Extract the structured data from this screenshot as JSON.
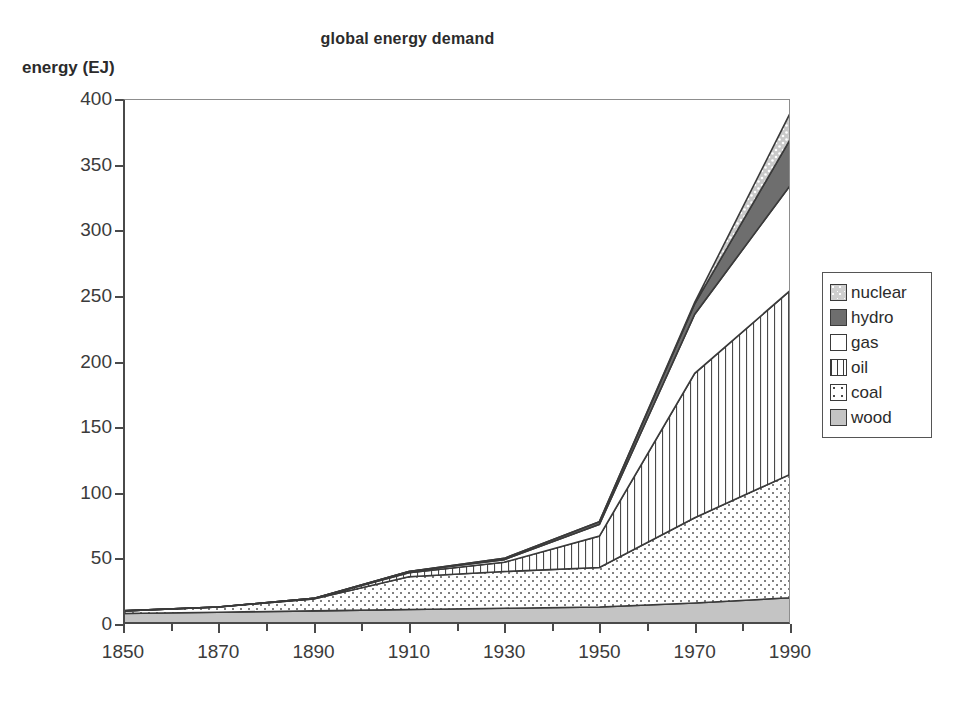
{
  "chart_data": {
    "type": "area",
    "title": "global energy demand",
    "xlabel": "",
    "ylabel": "energy (EJ)",
    "stacked": true,
    "grid": false,
    "legend_position": "right",
    "x": [
      1850,
      1870,
      1890,
      1910,
      1930,
      1950,
      1970,
      1990
    ],
    "categories": [
      "1850",
      "1870",
      "1890",
      "1910",
      "1930",
      "1950",
      "1970",
      "1990"
    ],
    "xlim": [
      1850,
      1990
    ],
    "ylim": [
      0,
      400
    ],
    "yticks": [
      "0",
      "50",
      "100",
      "150",
      "200",
      "250",
      "300",
      "350",
      "400"
    ],
    "ytick_values": [
      0,
      50,
      100,
      150,
      200,
      250,
      300,
      350,
      400
    ],
    "series": [
      {
        "name": "wood",
        "values": [
          8,
          9,
          10,
          11,
          12,
          13,
          16,
          20
        ],
        "color": "#c4c4c4",
        "pattern": "solid-light"
      },
      {
        "name": "coal",
        "values": [
          2,
          4,
          9,
          25,
          28,
          30,
          65,
          94
        ],
        "color": "#ffffff",
        "pattern": "dots"
      },
      {
        "name": "oil",
        "values": [
          0,
          0,
          0.5,
          3,
          7,
          24,
          110,
          140
        ],
        "color": "#ffffff",
        "pattern": "vertical-lines"
      },
      {
        "name": "gas",
        "values": [
          0,
          0,
          0,
          1,
          2,
          9,
          45,
          80
        ],
        "color": "#ffffff",
        "pattern": "blank"
      },
      {
        "name": "hydro",
        "values": [
          0,
          0,
          0,
          0,
          1,
          2,
          8,
          35
        ],
        "color": "#6e6e6e",
        "pattern": "solid-dark"
      },
      {
        "name": "nuclear",
        "values": [
          0,
          0,
          0,
          0,
          0,
          0,
          1,
          20
        ],
        "color": "#cfcfcf",
        "pattern": "speckle"
      }
    ],
    "totals": [
      10,
      13,
      19.5,
      40,
      50,
      78,
      245,
      389
    ]
  },
  "legend": {
    "items": [
      {
        "label": "nuclear",
        "swatch": "nuclear-swatch-icon"
      },
      {
        "label": "hydro",
        "swatch": "hydro-swatch-icon"
      },
      {
        "label": "gas",
        "swatch": "gas-swatch-icon"
      },
      {
        "label": "oil",
        "swatch": "oil-swatch-icon"
      },
      {
        "label": "coal",
        "swatch": "coal-swatch-icon"
      },
      {
        "label": "wood",
        "swatch": "wood-swatch-icon"
      }
    ]
  }
}
